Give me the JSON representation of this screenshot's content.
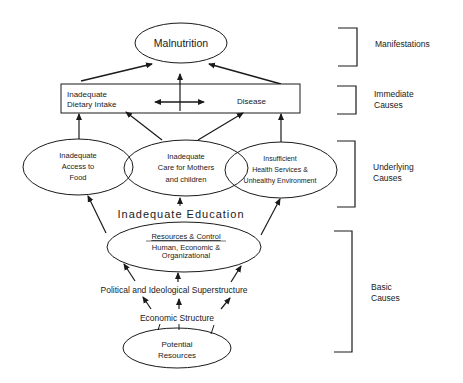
{
  "diagram": {
    "type": "causal-framework",
    "nodes": {
      "malnutrition": {
        "label": "Malnutrition"
      },
      "immediate_box": {
        "dietary_intake": [
          "Inadequate",
          "Dietary Intake"
        ],
        "disease": "Disease"
      },
      "access_food": {
        "lines": [
          "Inadequate",
          "Access to",
          "Food"
        ]
      },
      "care_mothers": {
        "lines": [
          "Inadequate",
          "Care for Mothers",
          "and children"
        ]
      },
      "health_services": {
        "lines": [
          "Insufficient",
          "Health Services &",
          "Unhealthy Environment"
        ]
      },
      "education": {
        "label": "Inadequate Education"
      },
      "resources_control": {
        "title": "Resources & Control",
        "lines": [
          "Human, Economic &",
          "Organizational"
        ]
      },
      "superstructure": {
        "label": "Political and Ideological Superstructure"
      },
      "economic_structure": {
        "label": "Economic Structure"
      },
      "potential_resources": {
        "lines": [
          "Potential",
          "Resources"
        ]
      }
    },
    "levels": [
      {
        "id": "manifestations",
        "lines": [
          "Manifestations"
        ]
      },
      {
        "id": "immediate",
        "lines": [
          "Immediate",
          "Causes"
        ]
      },
      {
        "id": "underlying",
        "lines": [
          "Underlying",
          "Causes"
        ]
      },
      {
        "id": "basic",
        "lines": [
          "Basic",
          "Causes"
        ]
      }
    ],
    "colors": {
      "stroke": "#1a1a1a",
      "background": "#ffffff"
    }
  }
}
